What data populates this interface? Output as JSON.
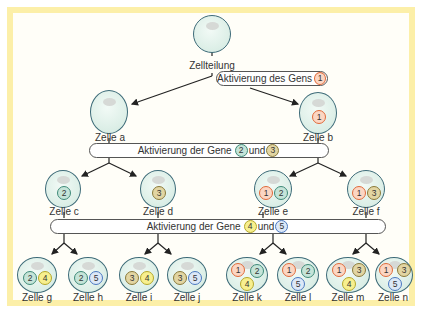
{
  "gene_colors": {
    "1": {
      "border": "#e06a3a",
      "fill": "#fbd6c3"
    },
    "2": {
      "border": "#3e8a78",
      "fill": "#c5e4d8"
    },
    "3": {
      "border": "#8a7a3a",
      "fill": "#e2d5a2"
    },
    "4": {
      "border": "#b5a82a",
      "fill": "#f7ef8e"
    },
    "5": {
      "border": "#4a78c0",
      "fill": "#dce8f7"
    }
  },
  "root": {
    "label": "Zellteilung"
  },
  "bars": [
    {
      "prefix": "Aktivierung des Gens",
      "genes": [
        "1"
      ],
      "joiner": ""
    },
    {
      "prefix": "Aktivierung der Gene",
      "genes": [
        "2",
        "3"
      ],
      "joiner": "und"
    },
    {
      "prefix": "Aktivierung der Gene",
      "genes": [
        "4",
        "5"
      ],
      "joiner": "und"
    }
  ],
  "cells": [
    {
      "id": "a",
      "label": "Zelle a",
      "genes": []
    },
    {
      "id": "b",
      "label": "Zelle b",
      "genes": [
        "1"
      ]
    },
    {
      "id": "c",
      "label": "Zelle c",
      "genes": [
        "2"
      ]
    },
    {
      "id": "d",
      "label": "Zelle d",
      "genes": [
        "3"
      ]
    },
    {
      "id": "e",
      "label": "Zelle e",
      "genes": [
        "1",
        "2"
      ]
    },
    {
      "id": "f",
      "label": "Zelle f",
      "genes": [
        "1",
        "3"
      ]
    },
    {
      "id": "g",
      "label": "Zelle g",
      "genes": [
        "2",
        "4"
      ]
    },
    {
      "id": "h",
      "label": "Zelle h",
      "genes": [
        "2",
        "5"
      ]
    },
    {
      "id": "i",
      "label": "Zelle i",
      "genes": [
        "3",
        "4"
      ]
    },
    {
      "id": "j",
      "label": "Zelle j",
      "genes": [
        "3",
        "5"
      ]
    },
    {
      "id": "k",
      "label": "Zelle k",
      "genes": [
        "1",
        "2",
        "4"
      ]
    },
    {
      "id": "l",
      "label": "Zelle l",
      "genes": [
        "1",
        "2",
        "5"
      ]
    },
    {
      "id": "m",
      "label": "Zelle m",
      "genes": [
        "1",
        "3",
        "4"
      ]
    },
    {
      "id": "n",
      "label": "Zelle n",
      "genes": [
        "1",
        "3",
        "5"
      ]
    }
  ]
}
